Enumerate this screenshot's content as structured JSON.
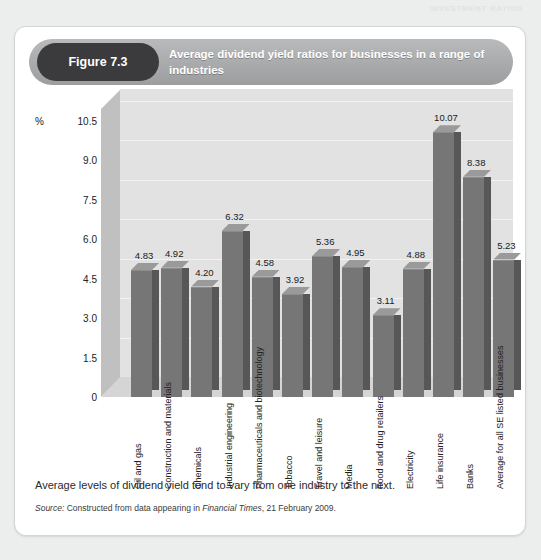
{
  "page": {
    "running_header": "INVESTMENT RATIOS"
  },
  "figure": {
    "badge_label": "Figure 7.3",
    "title": "Average dividend yield ratios for businesses in a range of industries",
    "caption": "Average levels of dividend yield tend to vary from one industry to the next.",
    "source_prefix": "Source:",
    "source_text_1": " Constructed from data appearing in ",
    "source_italic": "Financial Times",
    "source_text_2": ", 21 February 2009."
  },
  "colors": {
    "badge_bg": "#3b3b3d",
    "banner_bg": "#a9aaab",
    "bar_front": "#767676",
    "bar_side": "#575757",
    "bar_top": "#9a9a9a",
    "plot_bg": "#e2e2e2",
    "card_bg": "#ffffff",
    "page_bg": "#eceded"
  },
  "chart_data": {
    "type": "bar",
    "title": "Average dividend yield ratios for businesses in a range of industries",
    "xlabel": "",
    "ylabel": "%",
    "ylim": [
      0,
      10.5
    ],
    "yticks": [
      "0",
      "1.5",
      "3.0",
      "4.5",
      "6.0",
      "7.5",
      "9.0",
      "10.5"
    ],
    "ytick_values": [
      0,
      1.5,
      3.0,
      4.5,
      6.0,
      7.5,
      9.0,
      10.5
    ],
    "grid": true,
    "legend": "none",
    "three_d": true,
    "categories": [
      "Oil and gas",
      "Construction and materials",
      "Chemicals",
      "Industrial engineering",
      "Pharmaceuticals and biotechnology",
      "Tobacco",
      "Travel and leisure",
      "Media",
      "Food and drug retailers",
      "Electricity",
      "Life insurance",
      "Banks",
      "Average for all SE listed businesses"
    ],
    "values": [
      4.83,
      4.92,
      4.2,
      6.32,
      4.58,
      3.92,
      5.36,
      4.95,
      3.11,
      4.88,
      10.07,
      8.38,
      5.23
    ],
    "value_labels": [
      "4.83",
      "4.92",
      "4.20",
      "6.32",
      "4.58",
      "3.92",
      "5.36",
      "4.95",
      "3.11",
      "4.88",
      "10.07",
      "8.38",
      "5.23"
    ]
  }
}
